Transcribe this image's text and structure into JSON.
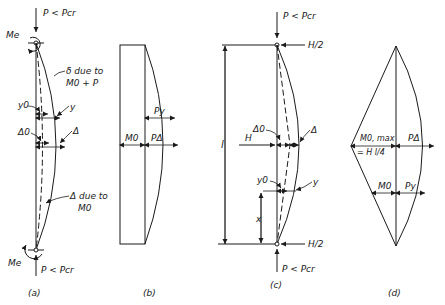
{
  "figure": {
    "panels": [
      {
        "id": "a",
        "caption": "(a)",
        "labels": {
          "top_load": "P < Pcr",
          "top_moment": "Me",
          "deflection_total": "δ due to",
          "deflection_total_2": "M0 + P",
          "y0": "y0",
          "y": "y",
          "delta0": "Δ0",
          "delta": "Δ",
          "deflection_first": "Δ due to",
          "deflection_first_2": "M0",
          "bottom_moment": "Me",
          "bottom_load": "P < Pcr"
        }
      },
      {
        "id": "b",
        "caption": "(b)",
        "labels": {
          "m0": "M0",
          "py": "Py",
          "pdelta": "PΔ"
        }
      },
      {
        "id": "c",
        "caption": "(c)",
        "labels": {
          "top_load": "P < Pcr",
          "top_reaction": "H/2",
          "length": "l",
          "lateral_load": "H",
          "delta0": "Δ0",
          "delta": "Δ",
          "y0": "y0",
          "y": "y",
          "x": "x",
          "bottom_reaction": "H/2",
          "bottom_load": "P < Pcr"
        }
      },
      {
        "id": "d",
        "caption": "(d)",
        "labels": {
          "m0max": "M0, max",
          "m0max_eq": "= H l/4",
          "pdelta": "PΔ",
          "m0": "M0",
          "py": "Py"
        }
      }
    ]
  }
}
